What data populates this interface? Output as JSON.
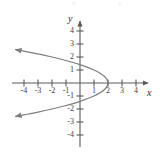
{
  "chart_data": {
    "type": "line",
    "title": "",
    "subtitle": "",
    "xlabel": "x",
    "ylabel": "y",
    "equation": "x = 2 - y^2",
    "orientation": "opens-left",
    "vertex": [
      2,
      0
    ],
    "xlim": [
      -4.7,
      4.9
    ],
    "ylim": [
      -4.7,
      4.9
    ],
    "grid": false,
    "legend": null,
    "legend_position": "none",
    "x_ticks": [
      -4,
      -3,
      -2,
      -1,
      1,
      2,
      3,
      4
    ],
    "y_ticks": [
      4,
      3,
      2,
      1,
      -1,
      -2,
      -3,
      -4
    ],
    "x_tick_labels": [
      "-4",
      "-3",
      "-2",
      "-1",
      "1",
      "2",
      "3",
      "4"
    ],
    "y_tick_labels": [
      "4",
      "3",
      "2",
      "1",
      "-1",
      "-2",
      "-3",
      "-4"
    ],
    "series": [
      {
        "name": "x = 2 - y^2",
        "color": "#7d7d7d",
        "arrow_start": true,
        "arrow_end": true,
        "points": [
          [
            -4.6,
            -2.57
          ],
          [
            -4.0,
            -2.45
          ],
          [
            -3.0,
            -2.24
          ],
          [
            -2.0,
            -2.0
          ],
          [
            -1.0,
            -1.73
          ],
          [
            0.0,
            -1.41
          ],
          [
            1.0,
            -1.0
          ],
          [
            1.5,
            -0.71
          ],
          [
            1.75,
            -0.5
          ],
          [
            1.9,
            -0.32
          ],
          [
            1.98,
            -0.14
          ],
          [
            2.0,
            0.0
          ],
          [
            1.98,
            0.14
          ],
          [
            1.9,
            0.32
          ],
          [
            1.75,
            0.5
          ],
          [
            1.5,
            0.71
          ],
          [
            1.0,
            1.0
          ],
          [
            0.0,
            1.41
          ],
          [
            -1.0,
            1.73
          ],
          [
            -2.0,
            2.0
          ],
          [
            -3.0,
            2.24
          ],
          [
            -4.0,
            2.45
          ],
          [
            -4.6,
            2.57
          ]
        ]
      }
    ]
  },
  "axes": {
    "x_name": "x",
    "y_name": "y",
    "axis_color": "#5a5a5a",
    "tick_color": "#5a5a5a",
    "label_color": "#3b3b3b"
  },
  "colors": {
    "background": "#ffffff",
    "curve": "#7d7d7d",
    "axis": "#5a5a5a",
    "text": "#3b3b3b"
  },
  "top_cropped_text": {
    "left": "g",
    "right": "x"
  }
}
